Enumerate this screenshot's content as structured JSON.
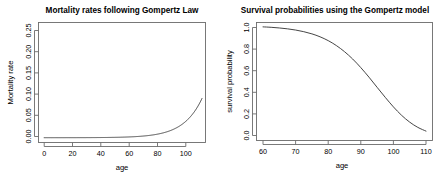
{
  "figure": {
    "background": "#ffffff",
    "line_color": "#3b3b3b",
    "axis_color": "#6b6b6b"
  },
  "chart_data": [
    {
      "type": "line",
      "panel": "left",
      "title": "Mortality rates following Gompertz Law",
      "xlabel": "age",
      "ylabel": "Mortality rate",
      "xlim": [
        -4,
        114
      ],
      "ylim": [
        -0.012,
        0.288
      ],
      "xticks": [
        0,
        20,
        40,
        60,
        80,
        100
      ],
      "xtick_labels": [
        "0",
        "20",
        "40",
        "60",
        "80",
        "100"
      ],
      "yticks": [
        0.0,
        0.05,
        0.1,
        0.15,
        0.2,
        0.25
      ],
      "ytick_labels": [
        "0.00",
        "0.05",
        "0.10",
        "0.15",
        "0.20",
        "0.25"
      ],
      "grid": false,
      "legend": "none",
      "series": [
        {
          "name": "Gompertz hazard",
          "x": [
            0,
            5,
            10,
            15,
            20,
            25,
            30,
            35,
            40,
            45,
            50,
            55,
            60,
            65,
            70,
            75,
            80,
            85,
            90,
            95,
            100,
            105,
            110
          ],
          "values": [
            2e-05,
            3e-05,
            4e-05,
            6e-05,
            9e-05,
            0.00013,
            0.00019,
            0.00028,
            0.00041,
            0.0006,
            0.00088,
            0.0013,
            0.0019,
            0.00279,
            0.0041,
            0.00601,
            0.00882,
            0.01294,
            0.019,
            0.02788,
            0.04092,
            0.06004,
            0.28
          ]
        }
      ]
    },
    {
      "type": "line",
      "panel": "right",
      "title": "Survival probabilities using the Gompertz model",
      "xlabel": "age",
      "ylabel": "survival probability",
      "xlim": [
        58,
        112
      ],
      "ylim": [
        -0.04,
        1.04
      ],
      "xticks": [
        60,
        70,
        80,
        90,
        100,
        110
      ],
      "xtick_labels": [
        "60",
        "70",
        "80",
        "90",
        "100",
        "110"
      ],
      "yticks": [
        0.0,
        0.2,
        0.4,
        0.6,
        0.8,
        1.0
      ],
      "ytick_labels": [
        "0.0",
        "0.2",
        "0.4",
        "0.6",
        "0.8",
        "1.0"
      ],
      "grid": false,
      "legend": "none",
      "series": [
        {
          "name": "Gompertz survival",
          "x": [
            60,
            62.5,
            65,
            67.5,
            70,
            72.5,
            75,
            77.5,
            80,
            82.5,
            85,
            87.5,
            90,
            92.5,
            95,
            97.5,
            100,
            102.5,
            105,
            107.5,
            110
          ],
          "values": [
            1.0,
            0.996,
            0.99,
            0.982,
            0.971,
            0.956,
            0.936,
            0.909,
            0.874,
            0.829,
            0.773,
            0.706,
            0.627,
            0.54,
            0.447,
            0.355,
            0.268,
            0.191,
            0.128,
            0.08,
            0.046
          ]
        }
      ]
    }
  ]
}
